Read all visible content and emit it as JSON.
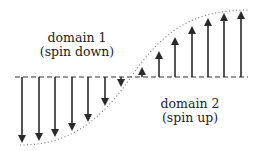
{
  "figure": {
    "type": "magnetic domain wall diagram",
    "baseline_y": 77,
    "colors": {
      "arrow": "#2a2a2a",
      "curve": "#777777",
      "baseline": "#333333",
      "text": "#222222"
    }
  },
  "domains": [
    {
      "id": "domain1",
      "title": "domain 1",
      "subtitle": "(spin down)"
    },
    {
      "id": "domain2",
      "title": "domain 2",
      "subtitle": "(spin up)"
    }
  ],
  "arrows": [
    {
      "x": 22,
      "tip": 143,
      "dir": "down"
    },
    {
      "x": 39,
      "tip": 141,
      "dir": "down"
    },
    {
      "x": 55,
      "tip": 137,
      "dir": "down"
    },
    {
      "x": 72,
      "tip": 131,
      "dir": "down"
    },
    {
      "x": 88,
      "tip": 122,
      "dir": "down"
    },
    {
      "x": 105,
      "tip": 106,
      "dir": "down"
    },
    {
      "x": 121,
      "tip": 87,
      "dir": "down"
    },
    {
      "x": 142,
      "tip": 67,
      "dir": "up"
    },
    {
      "x": 159,
      "tip": 51,
      "dir": "up"
    },
    {
      "x": 175,
      "tip": 37,
      "dir": "up"
    },
    {
      "x": 192,
      "tip": 26,
      "dir": "up"
    },
    {
      "x": 208,
      "tip": 18,
      "dir": "up"
    },
    {
      "x": 224,
      "tip": 13,
      "dir": "up"
    },
    {
      "x": 241,
      "tip": 11,
      "dir": "up"
    }
  ]
}
